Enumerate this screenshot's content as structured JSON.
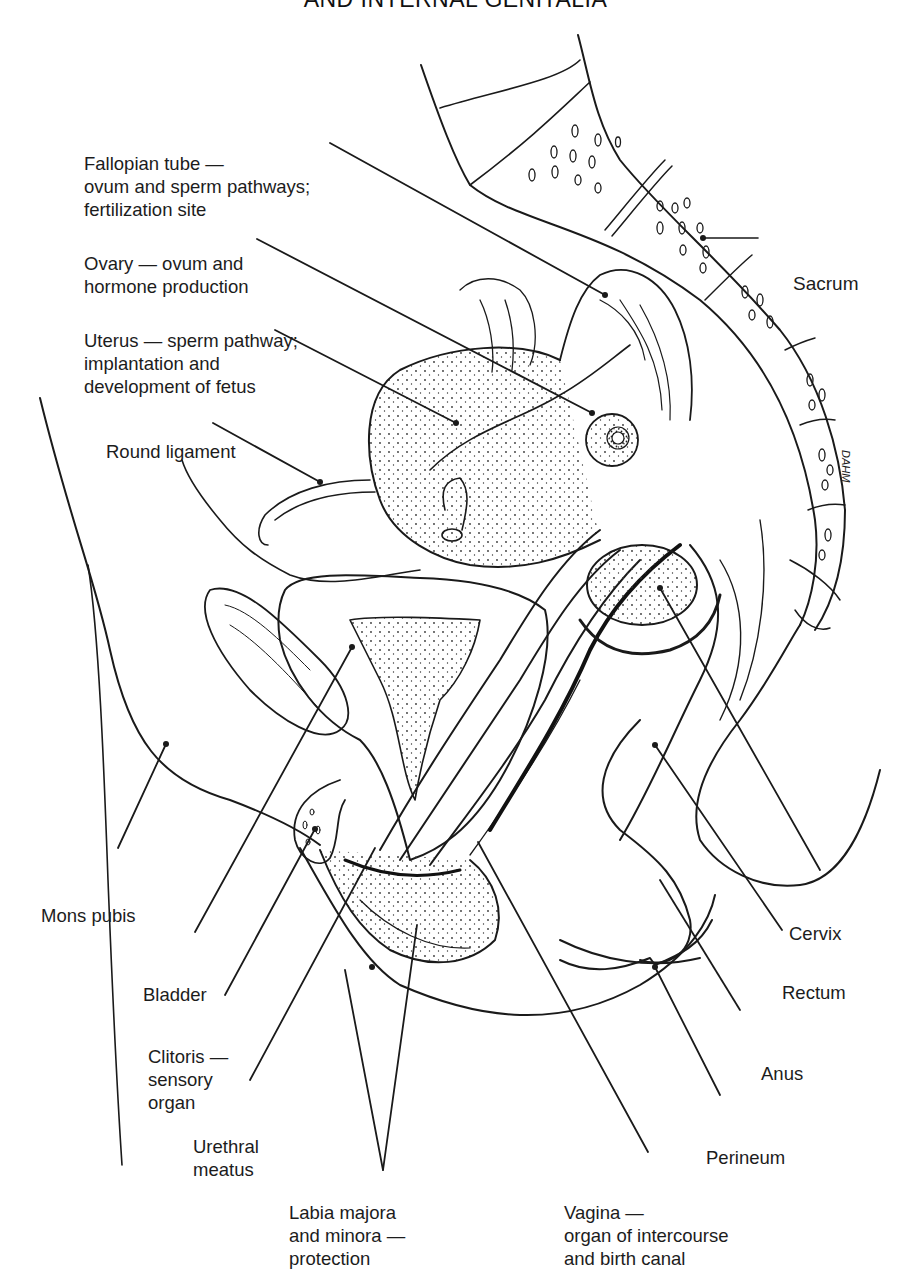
{
  "title": "AND INTERNAL GENITALIA",
  "colors": {
    "ink": "#1a1a1a",
    "background": "#ffffff"
  },
  "labels": {
    "fallopian_tube": {
      "lines": [
        "Fallopian tube —",
        "ovum and sperm pathways;",
        "fertilization site"
      ]
    },
    "ovary": {
      "lines": [
        "Ovary — ovum and",
        "hormone production"
      ]
    },
    "uterus": {
      "lines": [
        "Uterus — sperm pathway;",
        "implantation and",
        "development of fetus"
      ]
    },
    "round_ligament": {
      "lines": [
        "Round ligament"
      ]
    },
    "sacrum": {
      "lines": [
        "Sacrum"
      ]
    },
    "mons_pubis": {
      "lines": [
        "Mons pubis"
      ]
    },
    "bladder": {
      "lines": [
        "Bladder"
      ]
    },
    "clitoris": {
      "lines": [
        "Clitoris —",
        "sensory",
        "organ"
      ]
    },
    "urethral_meatus": {
      "lines": [
        "Urethral",
        "meatus"
      ]
    },
    "labia": {
      "lines": [
        "Labia majora",
        "and minora —",
        "protection"
      ]
    },
    "vagina": {
      "lines": [
        "Vagina —",
        "organ of intercourse",
        "and birth canal"
      ]
    },
    "cervix": {
      "lines": [
        "Cervix"
      ]
    },
    "rectum": {
      "lines": [
        "Rectum"
      ]
    },
    "anus": {
      "lines": [
        "Anus"
      ]
    },
    "perineum": {
      "lines": [
        "Perineum"
      ]
    }
  },
  "signature": "DAHM"
}
